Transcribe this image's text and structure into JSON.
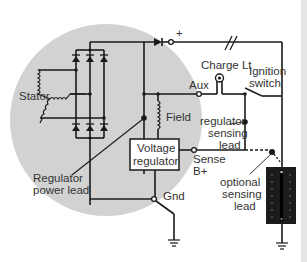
{
  "diagram": {
    "colors": {
      "alternator_circle": "#d2d2d2",
      "wire": "#1a1a1a",
      "label": "#333333",
      "battery": "#1c1c1c"
    },
    "labels": {
      "stator": "Stator",
      "plus": "+",
      "charge_lt": "Charge Lt",
      "ignition_switch_1": "Ignition",
      "ignition_switch_2": "switch",
      "aux": "Aux",
      "field": "Field",
      "regulator_sensing_1": "regulator",
      "regulator_sensing_2": "sensing",
      "regulator_sensing_3": "lead",
      "voltage_regulator_1": "Voltage",
      "voltage_regulator_2": "regulator",
      "sense_1": "Sense",
      "sense_2": "B+",
      "regulator_power_1": "Regulator",
      "regulator_power_2": "power lead",
      "gnd": "Gnd",
      "optional_sensing_1": "optional",
      "optional_sensing_2": "sensing",
      "optional_sensing_3": "lead"
    },
    "components": [
      {
        "name": "stator",
        "icon": "coil-icon"
      },
      {
        "name": "rectifier-bridge",
        "icon": "diode-icon",
        "diodes": 6
      },
      {
        "name": "output-diode",
        "icon": "diode-icon"
      },
      {
        "name": "charge-lamp",
        "icon": "lamp-icon"
      },
      {
        "name": "ignition-switch",
        "icon": "switch-icon"
      },
      {
        "name": "field-coil",
        "icon": "coil-icon"
      },
      {
        "name": "voltage-regulator",
        "icon": "box"
      },
      {
        "name": "battery",
        "icon": "battery-icon"
      },
      {
        "name": "ground-alternator",
        "icon": "ground-icon"
      },
      {
        "name": "ground-battery",
        "icon": "ground-icon"
      }
    ]
  }
}
